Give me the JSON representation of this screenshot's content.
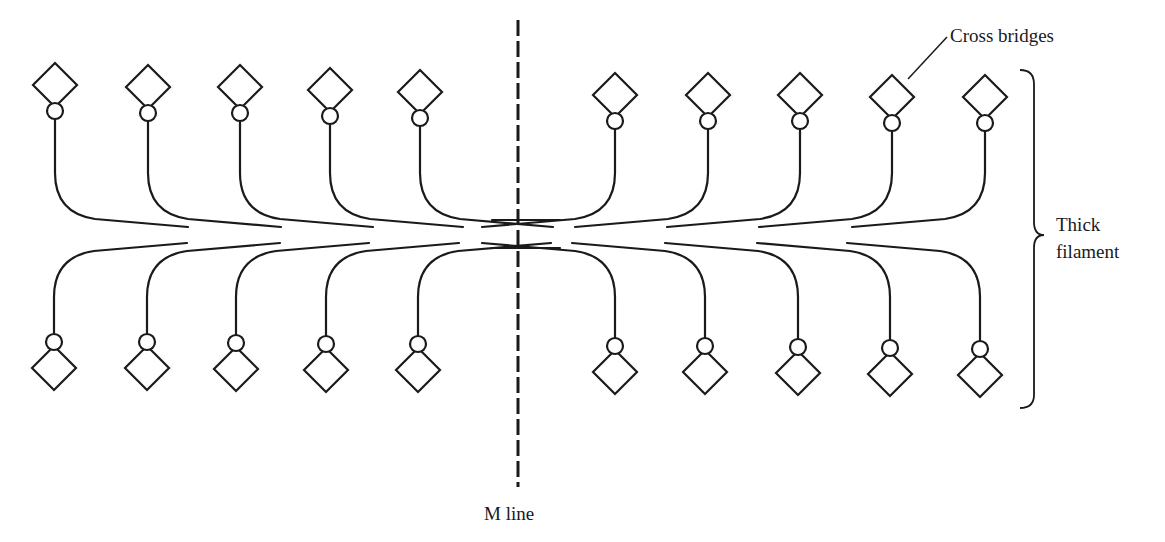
{
  "diagram": {
    "labels": {
      "cross_bridges": "Cross bridges",
      "thick_filament_line1": "Thick",
      "thick_filament_line2": "filament",
      "m_line": "M line"
    },
    "colors": {
      "stroke": "#1a1a1a",
      "background": "#ffffff"
    },
    "filament_center_y": 235,
    "m_line_x": 518,
    "heads": {
      "left_top": [
        {
          "x": 55,
          "y": 85
        },
        {
          "x": 148,
          "y": 87
        },
        {
          "x": 240,
          "y": 87
        },
        {
          "x": 330,
          "y": 90
        },
        {
          "x": 420,
          "y": 92
        }
      ],
      "right_top": [
        {
          "x": 615,
          "y": 95
        },
        {
          "x": 708,
          "y": 95
        },
        {
          "x": 800,
          "y": 95
        },
        {
          "x": 892,
          "y": 97
        },
        {
          "x": 985,
          "y": 97
        }
      ],
      "left_bottom": [
        {
          "x": 54,
          "y": 368
        },
        {
          "x": 147,
          "y": 368
        },
        {
          "x": 236,
          "y": 369
        },
        {
          "x": 326,
          "y": 370
        },
        {
          "x": 418,
          "y": 370
        }
      ],
      "right_bottom": [
        {
          "x": 615,
          "y": 372
        },
        {
          "x": 705,
          "y": 372
        },
        {
          "x": 798,
          "y": 373
        },
        {
          "x": 890,
          "y": 374
        },
        {
          "x": 980,
          "y": 375
        }
      ]
    }
  }
}
